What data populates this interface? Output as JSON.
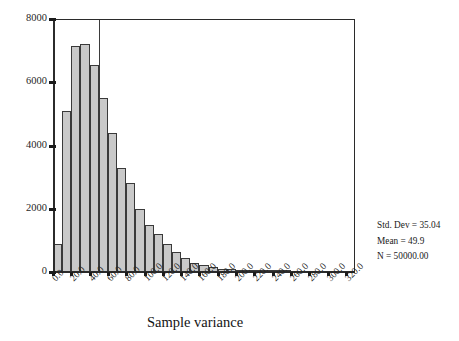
{
  "chart_data": {
    "type": "bar",
    "title": "",
    "xlabel": "Sample variance",
    "ylabel": "",
    "xlim": [
      0.0,
      330.0
    ],
    "ylim": [
      0,
      8000
    ],
    "bin_width": 10,
    "grid": false,
    "legend": null,
    "x_tick_labels": [
      "0.0",
      "20.0",
      "40.0",
      "60.0",
      "80.0",
      "100.0",
      "120.0",
      "140.0",
      "160.0",
      "180.0",
      "200.0",
      "220.0",
      "240.0",
      "260.0",
      "280.0",
      "300.0",
      "320.0"
    ],
    "x_tick_values": [
      0,
      20,
      40,
      60,
      80,
      100,
      120,
      140,
      160,
      180,
      200,
      220,
      240,
      260,
      280,
      300,
      320
    ],
    "y_tick_labels": [
      "0",
      "2000",
      "4000",
      "6000",
      "8000"
    ],
    "y_tick_values": [
      0,
      2000,
      4000,
      6000,
      8000
    ],
    "bin_starts": [
      0,
      10,
      20,
      30,
      40,
      50,
      60,
      70,
      80,
      90,
      100,
      110,
      120,
      130,
      140,
      150,
      160,
      170,
      180,
      190,
      200,
      210,
      220,
      230,
      240,
      250
    ],
    "values": [
      880,
      5100,
      7150,
      7200,
      6550,
      5500,
      4400,
      3300,
      2800,
      2000,
      1500,
      1200,
      880,
      620,
      450,
      300,
      210,
      150,
      110,
      80,
      55,
      40,
      28,
      18,
      12,
      8
    ],
    "annotations": {
      "std_dev": "Std. Dev = 35.04",
      "mean": "Mean = 49.9",
      "n": "N = 50000.00"
    }
  },
  "axis": {
    "x_title": "Sample variance"
  },
  "stats": {
    "line1": "Std. Dev = 35.04",
    "line2": "Mean = 49.9",
    "line3": "N = 50000.00"
  },
  "colors": {
    "bar_fill": "#c9c9c9",
    "bar_edge": "#3a3a3a",
    "axis": "#2b2b2b",
    "text": "#1a1a1a",
    "background": "#ffffff"
  }
}
